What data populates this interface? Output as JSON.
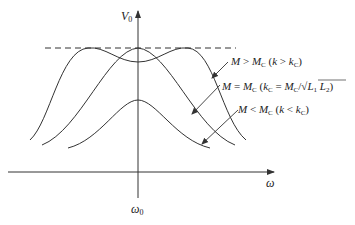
{
  "diagram": {
    "type": "frequency-response-curves",
    "axes": {
      "y_label": "V",
      "y_label_sub": "0",
      "x_label": "ω",
      "x_center_label": "ω",
      "x_center_label_sub": "0"
    },
    "reference_line": "dashed maximum level",
    "curves": [
      {
        "id": "over-coupled",
        "label_parts": {
          "a": "M",
          "op": " > ",
          "b": "M",
          "b_sub": "C",
          "paren_open": " (",
          "c": "k",
          "op2": " > ",
          "d": "k",
          "d_sub": "C",
          "paren_close": ")"
        },
        "shape": "double-peaked"
      },
      {
        "id": "critically-coupled",
        "label_parts": {
          "a": "M",
          "op": " = ",
          "b": "M",
          "b_sub": "C",
          "paren_open": " (",
          "c": "k",
          "c_sub": "C",
          "op2": " = ",
          "d": "M",
          "d_sub": "C",
          "slash": "/√",
          "e": "L",
          "e_sub": "1",
          "f": " L",
          "f_sub": "2",
          "paren_close": ")"
        },
        "shape": "single peak at max"
      },
      {
        "id": "under-coupled",
        "label_parts": {
          "a": "M",
          "op": " < ",
          "b": "M",
          "b_sub": "C",
          "paren_open": " (",
          "c": "k",
          "op2": " < ",
          "d": "k",
          "d_sub": "C",
          "paren_close": ")"
        },
        "shape": "single lower peak"
      }
    ],
    "colors": {
      "line": "#333333",
      "text": "#222222",
      "background": "#ffffff"
    }
  }
}
